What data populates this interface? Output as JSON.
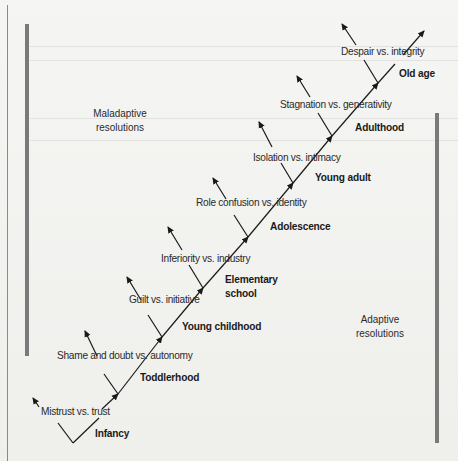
{
  "diagram": {
    "type": "branching stage diagram",
    "regions": {
      "maladaptive": {
        "line1": "Maladaptive",
        "line2": "resolutions"
      },
      "adaptive": {
        "line1": "Adaptive",
        "line2": "resolutions"
      }
    },
    "stages": [
      {
        "stage": "Infancy",
        "crisis": "Mistrust vs. trust"
      },
      {
        "stage": "Toddlerhood",
        "crisis": "Shame and doubt vs. autonomy"
      },
      {
        "stage": "Young childhood",
        "crisis": "Guilt vs. initiative"
      },
      {
        "stage_line1": "Elementary",
        "stage_line2": "school",
        "crisis": "Inferiority vs. industry"
      },
      {
        "stage": "Adolescence",
        "crisis": "Role confusion vs. identity"
      },
      {
        "stage": "Young adult",
        "crisis": "Isolation vs. intimacy"
      },
      {
        "stage": "Adulthood",
        "crisis": "Stagnation vs. generativity"
      },
      {
        "stage": "Old age",
        "crisis": "Despair vs. integrity"
      }
    ],
    "colors": {
      "line": "#1a1a1a",
      "bar": "#7a7a7a",
      "background": "#f2f2f0"
    }
  }
}
